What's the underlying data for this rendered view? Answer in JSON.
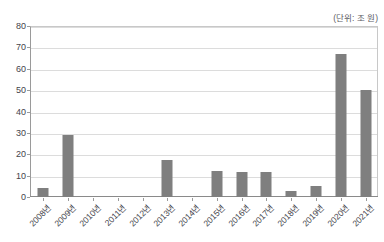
{
  "chart_data": {
    "type": "bar",
    "title": "",
    "subtitle": "",
    "unit_note": "(단위: 조 원)",
    "xlabel": "",
    "ylabel": "",
    "ylim": [
      0,
      80
    ],
    "ytick_step": 10,
    "yticks": [
      0,
      10,
      20,
      30,
      40,
      50,
      60,
      70,
      80
    ],
    "ytick_labels": [
      "0",
      "10",
      "20",
      "30",
      "40",
      "50",
      "60",
      "70",
      "80"
    ],
    "grid": true,
    "legend": false,
    "legend_position": "none",
    "bar_color": "#7f7f7f",
    "categories": [
      "2008년",
      "2009년",
      "2010년",
      "2011년",
      "2012년",
      "2013년",
      "2014년",
      "2015년",
      "2016년",
      "2017년",
      "2018년",
      "2019년",
      "2020년",
      "2021년"
    ],
    "values": [
      4,
      29,
      0,
      0,
      0,
      17.5,
      0,
      12,
      11.5,
      11.5,
      3,
      5,
      67,
      50
    ],
    "series": [
      {
        "name": "",
        "values": [
          4,
          29,
          0,
          0,
          0,
          17.5,
          0,
          12,
          11.5,
          11.5,
          3,
          5,
          67,
          50
        ]
      }
    ]
  },
  "colors": {
    "bar": "#7f7f7f",
    "grid": "#dcdcdc",
    "axis": "#9a9a9a",
    "text": "#42424a"
  }
}
